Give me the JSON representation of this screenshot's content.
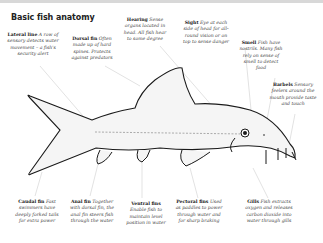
{
  "title": "Basic fish anatomy",
  "labels": [
    {
      "name": "Lateral line",
      "desc": "A row of sensory detects water movement – a fish's security alert"
    },
    {
      "name": "Dorsal fin",
      "desc": "Often made up of hard spines. Protects against predators"
    },
    {
      "name": "Hearing",
      "desc": "Sense organs located in head. All fish hear to some degree"
    },
    {
      "name": "Sight",
      "desc": "Eye at each side of head for all-round vision or on top to sense danger"
    },
    {
      "name": "Smell",
      "desc": "Fish have nostrils. Many fish rely on sense of smell to detect food"
    },
    {
      "name": "Barbels",
      "desc": "Sensory feelers around the mouth provide taste and touch"
    },
    {
      "name": "Caudal fin",
      "desc": "Fast swimmers have deeply forked tails for extra power"
    },
    {
      "name": "Anal fin",
      "desc": "Together with dorsal fin, the anal fin steers fish through the water"
    },
    {
      "name": "Ventral fins",
      "desc": "Enable fish to maintain level position in water"
    },
    {
      "name": "Pectoral fins",
      "desc": "Used as paddles to power through water and for sharp braking"
    },
    {
      "name": "Gills",
      "desc": "Fish extracts oxygen and releases carbon dioxide into water through gills"
    }
  ],
  "colors": {
    "outline": "#1a1a1a",
    "leader": "#bdbdbd",
    "body_fill": "#f4f4f4"
  }
}
